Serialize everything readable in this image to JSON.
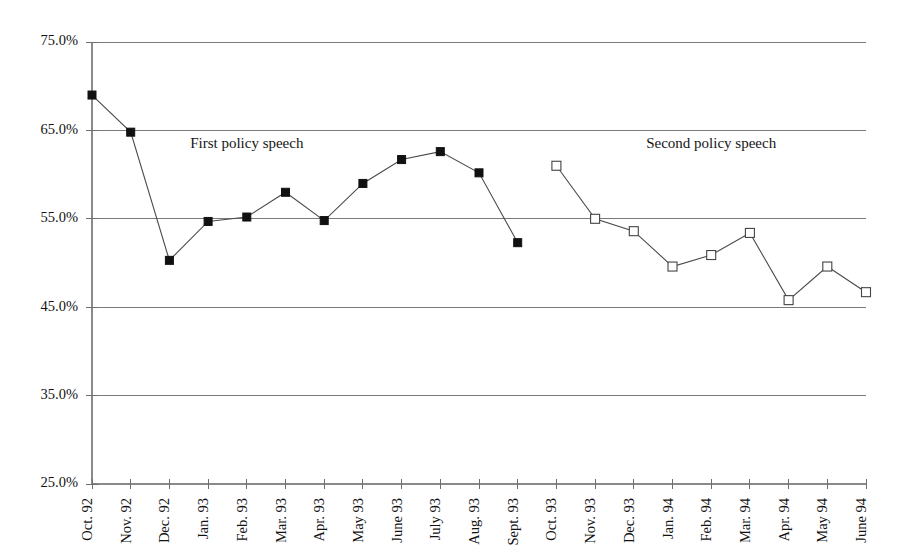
{
  "chart_data": {
    "type": "line",
    "title": "",
    "xlabel": "",
    "ylabel": "",
    "ylim": [
      25.0,
      75.0
    ],
    "ytick_values": [
      75.0,
      65.0,
      55.0,
      45.0,
      35.0,
      25.0
    ],
    "ytick_labels": [
      "75.0%",
      "65.0%",
      "55.0%",
      "45.0%",
      "35.0%",
      "25.0%"
    ],
    "grid": true,
    "grid_axis": "y",
    "legend": "none",
    "categories": [
      "Oct. 92",
      "Nov. 92",
      "Dec. 92",
      "Jan. 93",
      "Feb. 93",
      "Mar. 93",
      "Apr. 93",
      "May 93",
      "June 93",
      "July 93",
      "Aug. 93",
      "Sept. 93",
      "Oct. 93",
      "Nov. 93",
      "Dec. 93",
      "Jan. 94",
      "Feb. 94",
      "Mar. 94",
      "Apr. 94",
      "May 94",
      "June 94"
    ],
    "series": [
      {
        "name": "First policy speech period",
        "marker": "filled-square",
        "values": [
          69.0,
          64.8,
          50.3,
          54.7,
          55.2,
          58.0,
          54.8,
          59.0,
          61.7,
          62.6,
          60.2,
          52.3,
          null,
          null,
          null,
          null,
          null,
          null,
          null,
          null,
          null
        ]
      },
      {
        "name": "Second policy speech period",
        "marker": "hollow-square",
        "values": [
          null,
          null,
          null,
          null,
          null,
          null,
          null,
          null,
          null,
          null,
          null,
          null,
          61.0,
          55.0,
          53.6,
          49.6,
          50.9,
          53.4,
          45.8,
          49.6,
          46.7
        ]
      }
    ],
    "annotations": [
      {
        "text": "First policy speech",
        "category": "Feb. 93",
        "value": 63.0
      },
      {
        "text": "Second policy speech",
        "category": "Feb. 94",
        "value": 63.0
      }
    ]
  },
  "annotations": {
    "first": "First policy speech",
    "second": "Second policy speech"
  }
}
